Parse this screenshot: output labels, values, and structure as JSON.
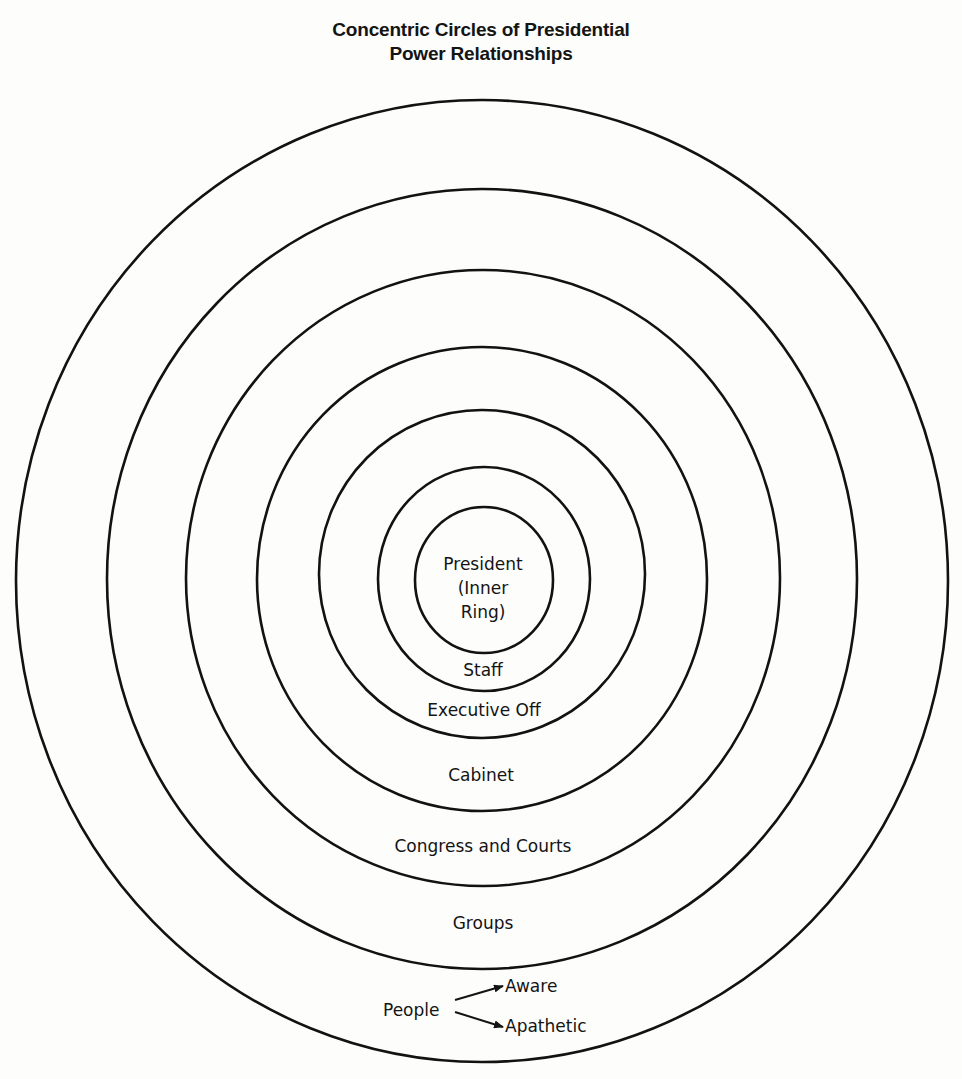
{
  "title": {
    "line1": "Concentric Circles of Presidential",
    "line2": "Power Relationships"
  },
  "rings": [
    {
      "id": "president",
      "cx": 484,
      "cy": 580,
      "rx": 69,
      "ry": 73
    },
    {
      "id": "staff",
      "cx": 484,
      "cy": 579,
      "rx": 106,
      "ry": 112
    },
    {
      "id": "executive-office",
      "cx": 482,
      "cy": 574,
      "rx": 163,
      "ry": 164
    },
    {
      "id": "cabinet",
      "cx": 482,
      "cy": 579,
      "rx": 225,
      "ry": 232
    },
    {
      "id": "congress-courts",
      "cx": 483,
      "cy": 578,
      "rx": 297,
      "ry": 308
    },
    {
      "id": "groups",
      "cx": 482,
      "cy": 579,
      "rx": 375,
      "ry": 390
    },
    {
      "id": "people",
      "cx": 482,
      "cy": 581,
      "rx": 466,
      "ry": 481
    }
  ],
  "labels": {
    "president_line1": "President",
    "president_line2": "(Inner",
    "president_line3": "Ring)",
    "staff": "Staff",
    "executive_office": "Executive Off",
    "cabinet": "Cabinet",
    "congress_courts": "Congress and Courts",
    "groups": "Groups",
    "people": "People",
    "aware": "Aware",
    "apathetic": "Apathetic"
  },
  "colors": {
    "ink": "#121212",
    "paper": "#fdfdfc"
  }
}
